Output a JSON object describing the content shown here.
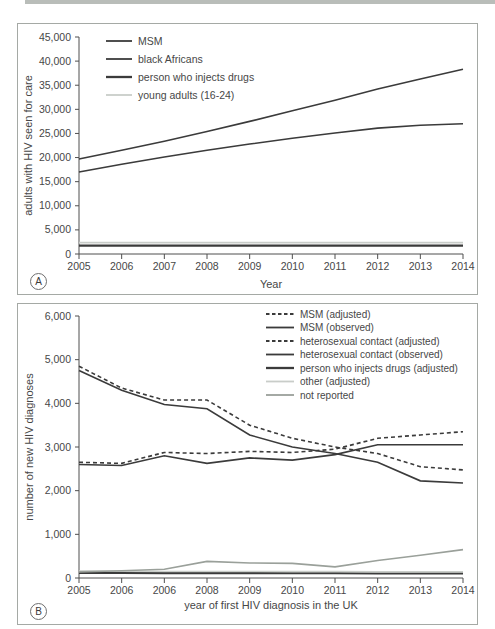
{
  "colors": {
    "dark": "#3b3b3b",
    "light": "#c9cdc9",
    "medium": "#9aa09a",
    "axis": "#4f4f4f",
    "text": "#474747",
    "panel_border": "#a5a9a5",
    "top_bar": "#b9bdb9"
  },
  "panels": [
    {
      "label": "A"
    },
    {
      "label": "B"
    }
  ],
  "chart_data": [
    {
      "type": "line",
      "panel": "A",
      "title": "",
      "xlabel": "Year",
      "ylabel": "adults with HIV seen for care",
      "x_tick_labels": [
        "2005",
        "2006",
        "2007",
        "2008",
        "2009",
        "2010",
        "2011",
        "2012",
        "2013",
        "2014"
      ],
      "ylim": [
        0,
        45000
      ],
      "ytick_step": 5000,
      "grid": false,
      "legend_position": "top-left-inside",
      "series": [
        {
          "name": "MSM",
          "style": "solid-dark",
          "values": [
            19700,
            21500,
            23400,
            25400,
            27500,
            29700,
            31900,
            34200,
            36300,
            38300
          ]
        },
        {
          "name": "black Africans",
          "style": "solid-dark",
          "values": [
            17000,
            18600,
            20100,
            21500,
            22800,
            24000,
            25100,
            26100,
            26700,
            27000
          ]
        },
        {
          "name": "person who injects drugs",
          "style": "solid-dark-thick",
          "values": [
            1750,
            1750,
            1750,
            1750,
            1750,
            1750,
            1750,
            1750,
            1750,
            1750
          ]
        },
        {
          "name": "young adults (16-24)",
          "style": "solid-light",
          "values": [
            2350,
            2350,
            2350,
            2350,
            2350,
            2350,
            2350,
            2350,
            2350,
            2350
          ]
        }
      ]
    },
    {
      "type": "line",
      "panel": "B",
      "title": "",
      "xlabel": "year of first HIV diagnosis in the UK",
      "ylabel": "number of new HIV diagnoses",
      "x_tick_labels": [
        "2005",
        "2006",
        "2006",
        "2008",
        "2009",
        "2010",
        "2011",
        "2012",
        "2013",
        "2014"
      ],
      "ylim": [
        0,
        6000
      ],
      "ytick_step": 1000,
      "grid": false,
      "legend_position": "top-right-inside",
      "series": [
        {
          "name": "MSM (adjusted)",
          "style": "dashed-dark",
          "values": [
            2650,
            2625,
            2875,
            2850,
            2900,
            2875,
            2950,
            3200,
            3275,
            3350
          ]
        },
        {
          "name": "MSM (observed)",
          "style": "solid-dark",
          "values": [
            2600,
            2575,
            2800,
            2625,
            2750,
            2700,
            2825,
            3050,
            3050,
            3050
          ]
        },
        {
          "name": "heterosexual contact (adjusted)",
          "style": "dashed-dark",
          "values": [
            4850,
            4350,
            4075,
            4075,
            3500,
            3200,
            3000,
            2850,
            2550,
            2475
          ]
        },
        {
          "name": "heterosexual contact (observed)",
          "style": "solid-dark",
          "values": [
            4750,
            4300,
            3975,
            3875,
            3275,
            3000,
            2850,
            2650,
            2225,
            2175
          ]
        },
        {
          "name": "person who injects drugs (adjusted)",
          "style": "solid-dark-thick",
          "values": [
            120,
            120,
            115,
            115,
            110,
            110,
            110,
            105,
            105,
            105
          ]
        },
        {
          "name": "other (adjusted)",
          "style": "solid-light",
          "values": [
            160,
            155,
            150,
            150,
            150,
            145,
            145,
            140,
            140,
            140
          ]
        },
        {
          "name": "not reported",
          "style": "solid-medium",
          "values": [
            140,
            165,
            200,
            380,
            345,
            335,
            255,
            400,
            520,
            650
          ]
        }
      ]
    }
  ]
}
